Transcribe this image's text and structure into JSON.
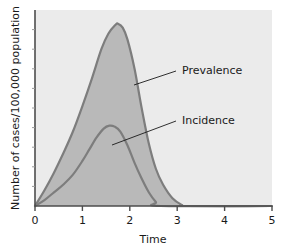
{
  "chart_data": {
    "type": "area",
    "title": "",
    "subtitle": "",
    "xlabel": "Time",
    "ylabel": "Number of cases/100,000 population",
    "xlim": [
      0,
      5
    ],
    "ylim": [
      0,
      1
    ],
    "xticks": [
      "0",
      "1",
      "2",
      "3",
      "4",
      "5"
    ],
    "xtick_values": [
      0,
      1,
      2,
      3,
      4,
      5
    ],
    "yticks": [],
    "grid": false,
    "legend_position": "inline-annotations",
    "plot_background": "#ebebeb",
    "fill_color": "#b9b9b9",
    "line_color": "#7d7d7d",
    "axis_color": "#4d4d4d",
    "series": [
      {
        "name": "Prevalence",
        "fill": "#b9b9b9",
        "stroke": "#7d7d7d",
        "peak_x": 1.75,
        "peak_y": 0.93,
        "end_x": 3.2,
        "x": [
          0.0,
          0.2,
          0.4,
          0.6,
          0.8,
          1.0,
          1.2,
          1.4,
          1.55,
          1.7,
          1.75,
          1.85,
          1.95,
          2.1,
          2.25,
          2.4,
          2.55,
          2.7,
          2.9,
          3.1,
          3.2,
          5.0
        ],
        "values": [
          0.0,
          0.08,
          0.17,
          0.27,
          0.38,
          0.51,
          0.65,
          0.8,
          0.88,
          0.925,
          0.93,
          0.91,
          0.85,
          0.7,
          0.5,
          0.32,
          0.19,
          0.11,
          0.04,
          0.005,
          0.0,
          0.0
        ]
      },
      {
        "name": "Incidence",
        "fill": "#b9b9b9",
        "stroke": "#7d7d7d",
        "peak_x": 1.57,
        "peak_y": 0.41,
        "end_x": 2.65,
        "x": [
          0.0,
          0.2,
          0.4,
          0.6,
          0.8,
          1.0,
          1.15,
          1.3,
          1.45,
          1.57,
          1.68,
          1.8,
          1.95,
          2.1,
          2.25,
          2.4,
          2.55,
          2.65,
          5.0
        ],
        "values": [
          0.0,
          0.03,
          0.07,
          0.11,
          0.16,
          0.23,
          0.29,
          0.35,
          0.395,
          0.41,
          0.405,
          0.38,
          0.31,
          0.22,
          0.14,
          0.07,
          0.02,
          0.0,
          0.0
        ]
      }
    ],
    "annotations": [
      {
        "label": "Prevalence",
        "text_x": 182,
        "text_y": 74,
        "leader_from_x": 176,
        "leader_from_y": 71,
        "leader_to_x": 134,
        "leader_to_y": 85
      },
      {
        "label": "Incidence",
        "text_x": 182,
        "text_y": 124,
        "leader_from_x": 176,
        "leader_from_y": 121,
        "leader_to_x": 112,
        "leader_to_y": 145
      }
    ]
  }
}
